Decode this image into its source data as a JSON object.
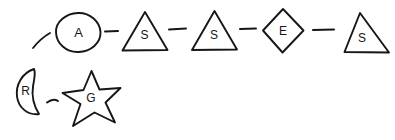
{
  "canvas": {
    "width": 395,
    "height": 140,
    "background_color": "#ffffff",
    "ink_color": "#161616",
    "style": "hand-drawn-sketch"
  },
  "diagram": {
    "title": "",
    "top_chain": {
      "nodes": [
        {
          "label": "A",
          "shape": "circle",
          "name": "node-a-circle"
        },
        {
          "label": "S",
          "shape": "triangle",
          "name": "node-s-triangle-1"
        },
        {
          "label": "S",
          "shape": "triangle",
          "name": "node-s-triangle-2"
        },
        {
          "label": "E",
          "shape": "diamond",
          "name": "node-e-diamond"
        },
        {
          "label": "S",
          "shape": "triangle",
          "name": "node-s-triangle-3"
        }
      ],
      "connectors": [
        {
          "kind": "dash",
          "name": "connector-a-to-s1"
        },
        {
          "kind": "dash",
          "name": "connector-s1-to-s2"
        },
        {
          "kind": "dash",
          "name": "connector-s2-to-e"
        },
        {
          "kind": "dash",
          "name": "connector-e-to-s3"
        }
      ],
      "lead_in": {
        "kind": "arc",
        "name": "lead-in-arc"
      }
    },
    "bottom_chain": {
      "nodes": [
        {
          "label": "R",
          "shape": "crescent",
          "name": "node-r-crescent"
        },
        {
          "label": "G",
          "shape": "star",
          "name": "node-g-star"
        }
      ],
      "connectors": [
        {
          "kind": "dash",
          "name": "connector-r-to-g"
        }
      ]
    }
  }
}
